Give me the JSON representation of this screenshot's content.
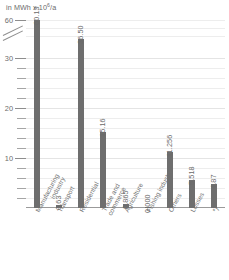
{
  "caption": {
    "unit_prefix": "in MWh x 10",
    "unit_exponent": "6",
    "unit_suffix": "/a",
    "full": "in MWh x 10⁶/a"
  },
  "axis": {
    "y_labels": [
      "60",
      "30",
      "20",
      "10"
    ],
    "break_marker": "axis-break",
    "y_label_60": "60",
    "y_label_30": "30",
    "y_label_20": "20",
    "y_label_10": "10"
  },
  "bars": [
    {
      "label_line1": "Manufacturing",
      "label_line2": "industry",
      "value": "60.13"
    },
    {
      "label_line1": "Transport",
      "label_line2": "",
      "value": "0.63"
    },
    {
      "label_line1": "Residential",
      "label_line2": "",
      "value": "36.50"
    },
    {
      "label_line1": "Trade and",
      "label_line2": "commerce",
      "value": "15.16"
    },
    {
      "label_line1": "Agriculture",
      "label_line2": "",
      "value": "0.865"
    },
    {
      "label_line1": "Fishing industry",
      "label_line2": "",
      "value": "0.000"
    },
    {
      "label_line1": "Others",
      "label_line2": "",
      "value": "11.256"
    },
    {
      "label_line1": "Losses",
      "label_line2": "",
      "value": "5.518"
    },
    {
      "label_line1": "*)",
      "label_line2": "",
      "value": "4.87"
    }
  ],
  "chart_data": {
    "type": "bar",
    "title": "",
    "subtitle": "",
    "xlabel": "",
    "ylabel": "in MWh x 10⁶/a",
    "categories": [
      "Manufacturing industry",
      "Transport",
      "Residential",
      "Trade and commerce",
      "Agriculture",
      "Fishing industry",
      "Others",
      "Losses",
      "*)"
    ],
    "values": [
      60.13,
      0.63,
      36.5,
      15.16,
      0.865,
      0.0,
      11.256,
      5.518,
      4.87
    ],
    "value_labels": [
      "60.13",
      "0.63",
      "36.50",
      "15.16",
      "0.865",
      "0.000",
      "11.256",
      "5.518",
      "4.87"
    ],
    "ylim": [
      0,
      60
    ],
    "yticks_labeled": [
      10,
      20,
      30,
      60
    ],
    "yticks_minor_step": 2,
    "axis_break": {
      "between": [
        30,
        60
      ],
      "style": "double-slash"
    },
    "grid": true,
    "grid_axis": "y",
    "legend": "none",
    "bar_color": "#6e6e6e",
    "grid_color": "#ededed",
    "text_color": "#6a6a6a",
    "background": "#ffffff",
    "value_label_rotation_deg": -90,
    "category_label_rotation_deg": -62
  }
}
